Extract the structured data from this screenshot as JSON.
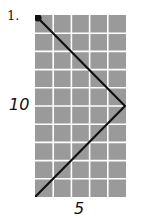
{
  "problem": {
    "number_label": "1.",
    "height_label": "10",
    "width_label": "5"
  },
  "grid": {
    "columns": 5,
    "rows": 10,
    "fill_color": "#9a9a9a",
    "line_color": "#ffffff"
  },
  "path": {
    "color": "#111111",
    "points_grid_units": [
      [
        0,
        0
      ],
      [
        5,
        5
      ],
      [
        0,
        10
      ]
    ],
    "start_dot": true
  }
}
